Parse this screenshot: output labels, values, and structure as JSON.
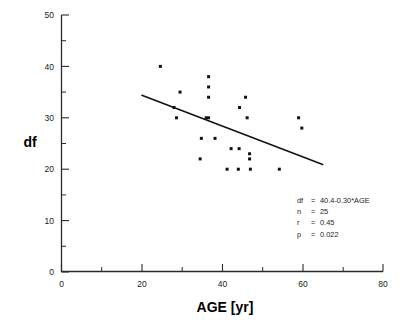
{
  "chart_data": {
    "type": "scatter",
    "title": "",
    "xlabel": "AGE   [yr]",
    "ylabel": "df",
    "xlim": [
      0,
      80
    ],
    "ylim": [
      0,
      50
    ],
    "xticks": [
      0,
      20,
      40,
      60,
      80
    ],
    "yticks": [
      0,
      10,
      20,
      30,
      40,
      50
    ],
    "xticklabels": [
      "0",
      "20",
      "40",
      "60",
      "80"
    ],
    "yticklabels": [
      "0",
      "10",
      "20",
      "30",
      "40",
      "50"
    ],
    "x_minor_ticks": [
      10,
      30,
      50,
      70
    ],
    "y_minor_ticks": [
      5,
      15,
      25,
      35,
      45
    ],
    "grid": false,
    "legend": null,
    "points": [
      {
        "x": 24.6,
        "y": 40
      },
      {
        "x": 28.0,
        "y": 32
      },
      {
        "x": 28.6,
        "y": 30
      },
      {
        "x": 29.5,
        "y": 35
      },
      {
        "x": 34.5,
        "y": 22
      },
      {
        "x": 34.8,
        "y": 26
      },
      {
        "x": 36.0,
        "y": 30
      },
      {
        "x": 36.6,
        "y": 30
      },
      {
        "x": 36.6,
        "y": 38
      },
      {
        "x": 36.6,
        "y": 36
      },
      {
        "x": 36.6,
        "y": 34
      },
      {
        "x": 38.2,
        "y": 26
      },
      {
        "x": 41.2,
        "y": 20
      },
      {
        "x": 42.2,
        "y": 24
      },
      {
        "x": 44.0,
        "y": 20
      },
      {
        "x": 44.2,
        "y": 24
      },
      {
        "x": 44.3,
        "y": 32
      },
      {
        "x": 45.8,
        "y": 34
      },
      {
        "x": 46.2,
        "y": 30
      },
      {
        "x": 46.8,
        "y": 23
      },
      {
        "x": 46.8,
        "y": 22
      },
      {
        "x": 47.0,
        "y": 20
      },
      {
        "x": 54.2,
        "y": 20
      },
      {
        "x": 59.0,
        "y": 30
      },
      {
        "x": 59.8,
        "y": 28
      }
    ],
    "fit_line": {
      "equation": "df = 40.4-0.30*AGE",
      "intercept": 40.4,
      "slope": -0.3,
      "x_start": 20,
      "x_end": 65,
      "y_start": 34.4,
      "y_end": 20.9
    },
    "annotations": [
      {
        "label": "df",
        "operator": "=",
        "value": "40.4-0.30*AGE"
      },
      {
        "label": "n",
        "operator": "=",
        "value": "25"
      },
      {
        "label": "r",
        "operator": "=",
        "value": "0.45"
      },
      {
        "label": "p",
        "operator": "=",
        "value": "0.022"
      }
    ],
    "stats": {
      "n": 25,
      "r": 0.45,
      "p": 0.022
    },
    "colors": {
      "marker": "#111111",
      "line": "#111111",
      "axis": "#2b2b2b",
      "text": "#1a1a1a",
      "background": "#ffffff"
    }
  }
}
